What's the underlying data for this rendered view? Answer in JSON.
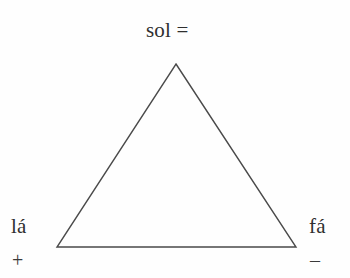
{
  "figure": {
    "type": "solfege-triangle-diagram",
    "background_color": "#fefefe",
    "stroke_color": "#4a4a4a",
    "text_color": "#2f2f2f"
  },
  "labels": {
    "apex": "sol =",
    "bottom_left": "lá",
    "bottom_right": "fá"
  },
  "signs": {
    "bottom_left": "+",
    "bottom_right": "–"
  },
  "geometry": {
    "apex": {
      "x": 176,
      "y": 64
    },
    "bottom_left": {
      "x": 57,
      "y": 247
    },
    "bottom_right": {
      "x": 296,
      "y": 247
    },
    "stroke_width": 1.4
  }
}
